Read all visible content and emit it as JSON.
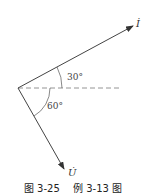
{
  "diagram": {
    "type": "phasor-diagram",
    "vectors": [
      {
        "name": "current",
        "label": "İ",
        "angle_deg": 30,
        "direction": "above reference"
      },
      {
        "name": "voltage",
        "label": "U̇",
        "angle_deg": -60,
        "direction": "below reference"
      }
    ],
    "reference_line": "dashed horizontal",
    "angles": {
      "current_angle": "30°",
      "voltage_angle": "60°"
    }
  },
  "caption": {
    "figure_number": "图 3-25",
    "figure_title": "例 3-13 图"
  }
}
